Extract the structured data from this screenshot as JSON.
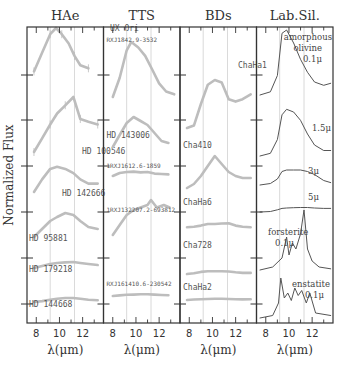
{
  "figure": {
    "ylabel": "Normalized Flux",
    "xlabel": "λ(μm)",
    "xticks": [
      "8",
      "10",
      "12"
    ],
    "colors": {
      "observed": "#bdbdbd",
      "lab": "#555555",
      "frame": "#333333",
      "grid": "#cfcfcf"
    },
    "panels": [
      {
        "title": "HAe",
        "labels": [
          "UX Ori",
          "HD 100546",
          "HD 142666",
          "HD 95881",
          "HD 179218",
          "HD 144668"
        ]
      },
      {
        "title": "TTS",
        "labels": [
          "RXJ1842.9-3532",
          "HD 143006",
          "1RXJ1612.6-1859",
          "1RXJ132207.2-693812",
          "RXJ161410.6-230542"
        ]
      },
      {
        "title": "BDs",
        "labels": [
          "ChaHa1",
          "Cha410",
          "ChaHa6",
          "Cha728",
          "ChaHa2"
        ]
      },
      {
        "title": "Lab.Sil.",
        "labels": [
          "amorphous",
          "olivine",
          "0.1μ",
          "1.5μ",
          "3μ",
          "5μ",
          "forsterite",
          "0.1μ",
          "enstatite",
          "0.1μ"
        ]
      }
    ]
  },
  "chart_data": {
    "type": "line",
    "title": "",
    "xlabel": "λ(μm)",
    "ylabel": "Normalized Flux",
    "xlim": [
      7.2,
      13.8
    ],
    "xticks": [
      8,
      10,
      12
    ],
    "grid_x": [
      9.2,
      11.3
    ],
    "layout": "4 panels side-by-side, shared x-axis, spectra vertically offset",
    "panels": [
      {
        "title": "HAe",
        "style": "observed (grey, with error bars)",
        "series": [
          {
            "name": "UX Ori",
            "x": [
              7.8,
              8.5,
              9.2,
              9.7,
              10.2,
              10.8,
              11.3,
              11.8,
              12.5
            ],
            "y": [
              0.3,
              0.6,
              0.9,
              1.0,
              0.9,
              0.75,
              0.55,
              0.4,
              0.35
            ]
          },
          {
            "name": "HD 100546",
            "x": [
              7.8,
              8.5,
              9.2,
              9.8,
              10.5,
              11.2,
              11.8,
              12.5,
              13.3
            ],
            "y": [
              0.0,
              0.25,
              0.5,
              0.7,
              0.85,
              1.0,
              0.6,
              0.55,
              0.5
            ]
          },
          {
            "name": "HD 142666",
            "x": [
              7.8,
              8.5,
              9.2,
              9.8,
              10.5,
              11.2,
              11.8,
              12.5,
              13.3
            ],
            "y": [
              0.0,
              0.3,
              0.55,
              0.6,
              0.55,
              0.45,
              0.3,
              0.2,
              0.2
            ]
          },
          {
            "name": "HD 95881",
            "x": [
              7.8,
              8.5,
              9.2,
              9.8,
              10.5,
              11.2,
              11.8,
              12.5,
              13.3
            ],
            "y": [
              0.0,
              0.2,
              0.4,
              0.5,
              0.6,
              0.55,
              0.4,
              0.25,
              0.2
            ]
          },
          {
            "name": "HD 179218",
            "x": [
              7.8,
              8.5,
              9.2,
              9.8,
              10.5,
              11.2,
              11.8,
              12.5,
              13.3
            ],
            "y": [
              0.0,
              0.1,
              0.2,
              0.25,
              0.28,
              0.3,
              0.25,
              0.2,
              0.15
            ]
          },
          {
            "name": "HD 144668",
            "x": [
              7.8,
              8.5,
              9.2,
              9.8,
              10.5,
              11.2,
              11.8,
              12.5,
              13.3
            ],
            "y": [
              0.0,
              0.05,
              0.12,
              0.18,
              0.22,
              0.22,
              0.18,
              0.12,
              0.1
            ]
          }
        ]
      },
      {
        "title": "TTS",
        "style": "observed (grey)",
        "series": [
          {
            "name": "RXJ1842.9-3532",
            "x": [
              8.0,
              8.6,
              9.2,
              9.6,
              10.2,
              10.8,
              11.4,
              12.0,
              12.6,
              13.3
            ],
            "y": [
              0.0,
              0.35,
              0.85,
              1.0,
              0.9,
              0.75,
              0.5,
              0.25,
              0.1,
              0.05
            ]
          },
          {
            "name": "HD 143006",
            "x": [
              8.0,
              8.6,
              9.2,
              9.8,
              10.4,
              11.0,
              11.6,
              12.2,
              12.8
            ],
            "y": [
              0.0,
              0.3,
              0.6,
              0.75,
              0.65,
              0.55,
              0.35,
              0.15,
              0.1
            ]
          },
          {
            "name": "1RXJ1612.6-1859",
            "x": [
              8.0,
              8.6,
              9.2,
              9.8,
              10.4,
              11.0,
              11.6,
              12.2,
              12.8
            ],
            "y": [
              0.0,
              0.15,
              0.2,
              0.22,
              0.18,
              0.2,
              0.12,
              0.1,
              0.08
            ]
          },
          {
            "name": "1RXJ132207.2-693812",
            "x": [
              8.0,
              8.6,
              9.2,
              9.8,
              10.4,
              11.0,
              11.3,
              11.8,
              12.4,
              12.9
            ],
            "y": [
              0.0,
              0.2,
              0.4,
              0.5,
              0.55,
              0.6,
              0.7,
              0.55,
              0.6,
              0.55
            ]
          },
          {
            "name": "RXJ161410.6-230542",
            "x": [
              8.0,
              8.6,
              9.2,
              9.8,
              10.4,
              11.0,
              11.6,
              12.2,
              12.8
            ],
            "y": [
              0.0,
              0.05,
              0.1,
              0.12,
              0.14,
              0.15,
              0.12,
              0.08,
              0.06
            ]
          }
        ]
      },
      {
        "title": "BDs",
        "style": "observed (grey)",
        "series": [
          {
            "name": "ChaHa1",
            "x": [
              7.8,
              8.4,
              9.0,
              9.6,
              10.2,
              10.8,
              11.4,
              12.0,
              12.6,
              13.3
            ],
            "y": [
              0.0,
              0.05,
              0.5,
              0.9,
              1.0,
              0.95,
              0.6,
              0.55,
              0.6,
              0.7
            ]
          },
          {
            "name": "Cha410",
            "x": [
              7.8,
              8.4,
              9.0,
              9.6,
              10.2,
              10.8,
              11.4,
              12.0,
              12.6,
              13.3
            ],
            "y": [
              0.0,
              0.1,
              0.3,
              0.55,
              0.8,
              0.6,
              0.4,
              0.3,
              0.25,
              0.25
            ]
          },
          {
            "name": "ChaHa6",
            "x": [
              7.8,
              8.4,
              9.0,
              9.6,
              10.2,
              10.8,
              11.4,
              12.0,
              12.6,
              13.3
            ],
            "y": [
              0.05,
              0.08,
              0.15,
              0.25,
              0.25,
              0.28,
              0.3,
              0.15,
              0.08,
              0.05
            ]
          },
          {
            "name": "Cha728",
            "x": [
              7.8,
              8.4,
              9.0,
              9.6,
              10.2,
              10.8,
              11.4,
              12.0,
              12.6,
              13.3
            ],
            "y": [
              0.0,
              0.05,
              0.15,
              0.2,
              0.2,
              0.2,
              0.18,
              0.12,
              0.08,
              0.08
            ]
          },
          {
            "name": "ChaHa2",
            "x": [
              7.8,
              8.4,
              9.0,
              9.6,
              10.2,
              10.8,
              11.4,
              12.0,
              12.6,
              13.3
            ],
            "y": [
              0.0,
              0.05,
              0.08,
              0.1,
              0.12,
              0.12,
              0.1,
              0.08,
              0.06,
              0.08
            ]
          }
        ]
      },
      {
        "title": "Lab.Sil.",
        "style": "laboratory (dark line)",
        "series": [
          {
            "name": "amorphous olivine 0.1μ",
            "x": [
              7.5,
              8.4,
              9.0,
              9.4,
              9.8,
              10.4,
              11.0,
              11.6,
              12.2,
              13.0,
              13.6
            ],
            "y": [
              0.0,
              0.05,
              0.3,
              0.95,
              1.0,
              0.8,
              0.55,
              0.35,
              0.2,
              0.15,
              0.18
            ]
          },
          {
            "name": "amorphous olivine 1.5μ",
            "x": [
              7.5,
              8.4,
              9.0,
              9.4,
              9.8,
              10.4,
              11.0,
              11.6,
              12.2,
              13.0,
              13.6
            ],
            "y": [
              0.0,
              0.05,
              0.3,
              0.75,
              0.85,
              0.8,
              0.65,
              0.4,
              0.2,
              0.1,
              0.1
            ]
          },
          {
            "name": "amorphous olivine 3μ",
            "x": [
              7.5,
              8.4,
              9.0,
              9.4,
              9.8,
              10.4,
              11.0,
              11.6,
              12.2,
              13.0,
              13.6
            ],
            "y": [
              0.0,
              0.05,
              0.2,
              0.45,
              0.5,
              0.5,
              0.5,
              0.45,
              0.35,
              0.15,
              0.08
            ]
          },
          {
            "name": "amorphous olivine 5μ",
            "x": [
              7.5,
              8.4,
              9.0,
              9.4,
              9.8,
              10.4,
              11.0,
              11.6,
              12.2,
              13.0,
              13.6
            ],
            "y": [
              0.0,
              0.03,
              0.12,
              0.2,
              0.22,
              0.24,
              0.25,
              0.25,
              0.22,
              0.2,
              0.2
            ]
          },
          {
            "name": "forsterite 0.1μ",
            "x": [
              7.5,
              8.6,
              9.4,
              9.8,
              10.0,
              10.3,
              10.6,
              11.0,
              11.3,
              11.6,
              12.0,
              12.6,
              13.6
            ],
            "y": [
              0.0,
              0.05,
              0.2,
              0.55,
              0.25,
              0.45,
              0.35,
              0.6,
              1.0,
              0.35,
              0.15,
              0.05,
              0.02
            ]
          },
          {
            "name": "enstatite 0.1μ",
            "x": [
              7.5,
              8.6,
              9.1,
              9.3,
              9.6,
              9.9,
              10.2,
              10.5,
              10.8,
              11.1,
              11.5,
              11.8,
              12.3,
              13.6
            ],
            "y": [
              0.0,
              0.05,
              0.3,
              0.8,
              0.4,
              0.5,
              0.35,
              0.6,
              0.45,
              0.55,
              0.3,
              0.5,
              0.1,
              0.05
            ]
          }
        ]
      }
    ]
  }
}
